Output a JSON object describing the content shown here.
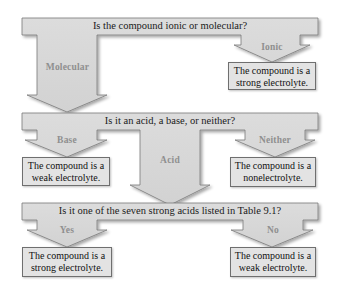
{
  "diagram": {
    "colors": {
      "shape_fill": "#d9d9d9",
      "shape_stroke": "#7a7a7a",
      "box_fill": "#e3e3e3",
      "label_color": "#8f8f8f",
      "text_color": "#1a1a1a"
    },
    "level1": {
      "question": "Is the compound ionic or molecular?",
      "branches": {
        "molecular": {
          "label": "Molecular"
        },
        "ionic": {
          "label": "Ionic",
          "result": {
            "line1": "The compound is a",
            "line2": "strong electrolyte."
          }
        }
      }
    },
    "level2": {
      "question": "Is it an acid, a base, or neither?",
      "branches": {
        "base": {
          "label": "Base",
          "result": {
            "line1": "The compound is a",
            "line2": "weak electrolyte."
          }
        },
        "acid": {
          "label": "Acid"
        },
        "neither": {
          "label": "Neither",
          "result": {
            "line1": "The compound is a",
            "line2": "nonelectrolyte."
          }
        }
      }
    },
    "level3": {
      "question": "Is it one of the seven strong acids listed in Table 9.1?",
      "branches": {
        "yes": {
          "label": "Yes",
          "result": {
            "line1": "The compound is a",
            "line2": "strong electrolyte."
          }
        },
        "no": {
          "label": "No",
          "result": {
            "line1": "The compound is a",
            "line2": "weak electrolyte."
          }
        }
      }
    }
  }
}
